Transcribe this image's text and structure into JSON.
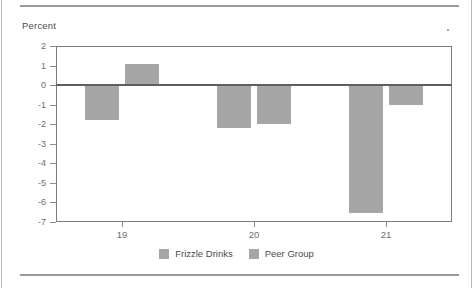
{
  "figure": {
    "y_axis_title": "Percent",
    "series_color": "#a6a6a6",
    "axis_color": "#7d7d7d",
    "text_color": "#5a5a5a"
  },
  "legend": {
    "items": [
      {
        "label": "Frizzle Drinks",
        "color": "#a6a6a6",
        "swatch": "square-swatch"
      },
      {
        "label": "Peer Group",
        "color": "#a6a6a6",
        "swatch": "square-swatch"
      }
    ]
  },
  "chart_data": {
    "type": "bar",
    "title": "",
    "subtitle": "",
    "xlabel": "",
    "ylabel": "Percent",
    "categories": [
      "19",
      "20",
      "21"
    ],
    "series": [
      {
        "name": "Frizzle Drinks",
        "values": [
          -1.8,
          -2.2,
          -6.55
        ]
      },
      {
        "name": "Peer Group",
        "values": [
          1.1,
          -2.0,
          -1.0
        ]
      }
    ],
    "ylim": [
      -7,
      2
    ],
    "ytick_labels": [
      "2",
      "1",
      "0",
      "-1",
      "-2",
      "-3",
      "-4",
      "-5",
      "-6",
      "-7"
    ],
    "ytick_values": [
      2,
      1,
      0,
      -1,
      -2,
      -3,
      -4,
      -5,
      -6,
      -7
    ],
    "xtick_labels": [
      "19",
      "20",
      "21"
    ],
    "grid": false,
    "zero_line": true,
    "legend_position": "bottom"
  }
}
